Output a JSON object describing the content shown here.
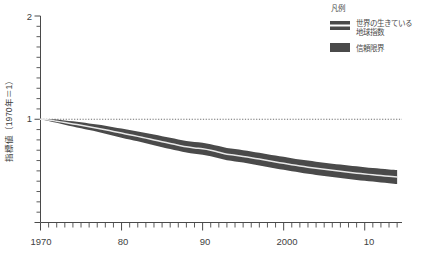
{
  "chart_data": {
    "type": "line",
    "title": "",
    "subtitle": "",
    "xlabel": "",
    "ylabel": "指標値（1970年＝1）",
    "xlim": [
      1970,
      2014
    ],
    "ylim": [
      0,
      2
    ],
    "grid": false,
    "y_ticks_labeled": [
      "2",
      "1"
    ],
    "y_tick_values": [
      2,
      1
    ],
    "y_minor_tick_step": 0.1,
    "x_ticks_labeled": [
      "1970",
      "80",
      "90",
      "2000",
      "10"
    ],
    "x_tick_values": [
      1970,
      1980,
      1990,
      2000,
      2010
    ],
    "x_minor_tick_step": 1,
    "reference_line": {
      "y": 1,
      "style": "dotted"
    },
    "legend": {
      "position": "top-right",
      "title": "凡例",
      "entries": [
        {
          "label": "世界の生きている地球指数",
          "swatch": "band-with-line",
          "color": "#4a4a4a"
        },
        {
          "label": "信頼限界",
          "swatch": "solid-band",
          "color": "#4a4a4a"
        }
      ]
    },
    "series": [
      {
        "name": "世界の生きている地球指数",
        "color": "#e8e8e8",
        "x": [
          1970,
          1971,
          1972,
          1973,
          1974,
          1975,
          1976,
          1977,
          1978,
          1979,
          1980,
          1981,
          1982,
          1983,
          1984,
          1985,
          1986,
          1987,
          1988,
          1989,
          1990,
          1991,
          1992,
          1993,
          1994,
          1995,
          1996,
          1997,
          1998,
          1999,
          2000,
          2001,
          2002,
          2003,
          2004,
          2005,
          2006,
          2007,
          2008,
          2009,
          2010,
          2011,
          2012,
          2013,
          2014
        ],
        "values": [
          1.0,
          0.993,
          0.981,
          0.968,
          0.955,
          0.941,
          0.927,
          0.913,
          0.898,
          0.882,
          0.866,
          0.85,
          0.834,
          0.817,
          0.8,
          0.783,
          0.766,
          0.749,
          0.733,
          0.722,
          0.714,
          0.7,
          0.681,
          0.662,
          0.652,
          0.64,
          0.627,
          0.614,
          0.6,
          0.586,
          0.573,
          0.56,
          0.548,
          0.536,
          0.525,
          0.515,
          0.505,
          0.496,
          0.487,
          0.478,
          0.47,
          0.462,
          0.454,
          0.447,
          0.44
        ]
      },
      {
        "name": "信頼限界 上限",
        "color": "#4a4a4a",
        "x": [
          1970,
          1971,
          1972,
          1973,
          1974,
          1975,
          1976,
          1977,
          1978,
          1979,
          1980,
          1981,
          1982,
          1983,
          1984,
          1985,
          1986,
          1987,
          1988,
          1989,
          1990,
          1991,
          1992,
          1993,
          1994,
          1995,
          1996,
          1997,
          1998,
          1999,
          2000,
          2001,
          2002,
          2003,
          2004,
          2005,
          2006,
          2007,
          2008,
          2009,
          2010,
          2011,
          2012,
          2013,
          2014
        ],
        "values": [
          1.0,
          1.003,
          0.997,
          0.989,
          0.98,
          0.97,
          0.959,
          0.948,
          0.936,
          0.923,
          0.91,
          0.896,
          0.882,
          0.867,
          0.852,
          0.836,
          0.82,
          0.804,
          0.789,
          0.779,
          0.772,
          0.758,
          0.74,
          0.722,
          0.712,
          0.7,
          0.688,
          0.675,
          0.662,
          0.649,
          0.636,
          0.623,
          0.611,
          0.6,
          0.589,
          0.579,
          0.57,
          0.561,
          0.552,
          0.544,
          0.536,
          0.528,
          0.521,
          0.514,
          0.508
        ]
      },
      {
        "name": "信頼限界 下限",
        "color": "#4a4a4a",
        "x": [
          1970,
          1971,
          1972,
          1973,
          1974,
          1975,
          1976,
          1977,
          1978,
          1979,
          1980,
          1981,
          1982,
          1983,
          1984,
          1985,
          1986,
          1987,
          1988,
          1989,
          1990,
          1991,
          1992,
          1993,
          1994,
          1995,
          1996,
          1997,
          1998,
          1999,
          2000,
          2001,
          2002,
          2003,
          2004,
          2005,
          2006,
          2007,
          2008,
          2009,
          2010,
          2011,
          2012,
          2013,
          2014
        ],
        "values": [
          1.0,
          0.983,
          0.965,
          0.947,
          0.93,
          0.912,
          0.895,
          0.878,
          0.86,
          0.841,
          0.822,
          0.804,
          0.786,
          0.767,
          0.748,
          0.73,
          0.712,
          0.694,
          0.677,
          0.665,
          0.656,
          0.642,
          0.622,
          0.602,
          0.592,
          0.58,
          0.566,
          0.553,
          0.538,
          0.523,
          0.51,
          0.497,
          0.485,
          0.472,
          0.461,
          0.451,
          0.44,
          0.431,
          0.422,
          0.412,
          0.404,
          0.396,
          0.387,
          0.38,
          0.372
        ]
      }
    ]
  },
  "axes": {
    "y_label": "指標値（1970年＝1）",
    "y_tick_top": "2",
    "y_tick_mid": "1",
    "x_tick_1": "1970",
    "x_tick_2": "80",
    "x_tick_3": "90",
    "x_tick_4": "2000",
    "x_tick_5": "10"
  },
  "legend": {
    "title": "凡例",
    "item1": "世界の生きている",
    "item1b": "地球指数",
    "item2": "信頼限界"
  },
  "colors": {
    "band": "#4a4a4a",
    "line": "#ededed",
    "axis": "#4a4a4a",
    "text": "#3f3f3f",
    "background": "#ffffff"
  }
}
